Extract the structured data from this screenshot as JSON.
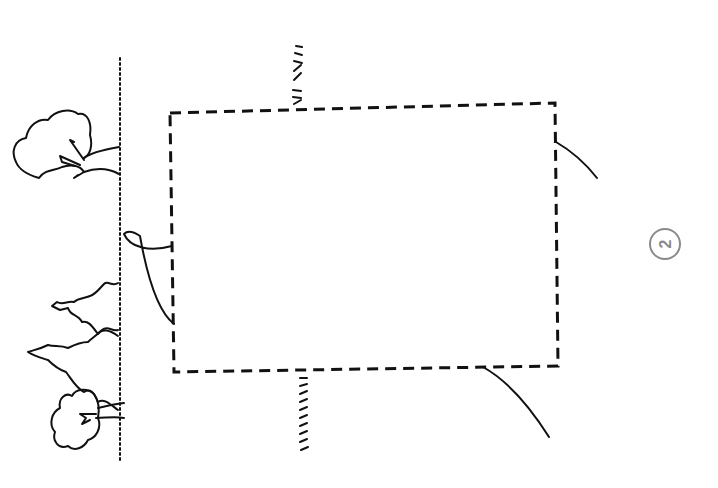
{
  "drawing": {
    "kind": "hand-drawn site plan sketch (rotated 90°)",
    "page_marker": "2",
    "colors": {
      "ink": "#111111",
      "marker": "#8a8a8a",
      "background": "#ffffff"
    },
    "elements": [
      "dashed building footprint rectangle",
      "left hatched boundary line",
      "top hatched stub wall",
      "bottom hatched stub wall",
      "deciduous tree (upper left)",
      "two conifer trees (left)",
      "deciduous tree (lower left)",
      "curved path from left edge to footprint",
      "curved lines from right/bottom edges of footprint"
    ]
  }
}
